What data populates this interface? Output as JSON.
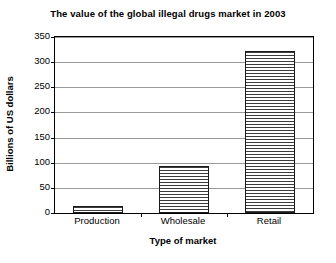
{
  "chart_data": {
    "type": "bar",
    "title": "The value of the global illegal drugs market in 2003",
    "xlabel": "Type of market",
    "ylabel": "Billions of US dollars",
    "categories": [
      "Production",
      "Wholesale",
      "Retail"
    ],
    "values": [
      13,
      94,
      322
    ],
    "ylim": [
      0,
      350
    ],
    "yticks": [
      0,
      50,
      100,
      150,
      200,
      250,
      300,
      350
    ],
    "ytick_labels": [
      "0",
      "50",
      "100",
      "150",
      "200",
      "250",
      "300",
      "350"
    ],
    "grid": true,
    "legend": null,
    "series": [
      {
        "name": "Value",
        "values": [
          13,
          94,
          322
        ]
      }
    ],
    "bar_fill": "horizontal-stripes",
    "bar_edge_color": "#1a1a1a",
    "gridline_color": "#9a9a9a",
    "axis_color": "#000000",
    "background_color": "#ffffff"
  }
}
